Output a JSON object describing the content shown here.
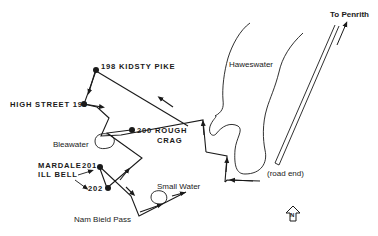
{
  "map": {
    "colors": {
      "ink": "#1a1a1a",
      "background": "#ffffff"
    },
    "labels": {
      "to_penrith": "To Penrith",
      "haweswater": "Haweswater",
      "kidsty_pike": "198 KIDSTY PIKE",
      "high_street": "HIGH STREET 199",
      "rough_crag_1": "200 ROUGH",
      "rough_crag_2": "CRAG",
      "bleawater": "Bleawater",
      "mardale_1": "MARDALE",
      "mardale_2": "ILL BELL",
      "point_201": "201",
      "point_202": "202",
      "small_water": "Small Water",
      "nam_bield_pass": "Nam Bield Pass",
      "road_end": "(road end)",
      "north_arrow": "N"
    },
    "waypoints": [
      {
        "id": "198",
        "name": "Kidsty Pike"
      },
      {
        "id": "199",
        "name": "High Street"
      },
      {
        "id": "200",
        "name": "Rough Crag"
      },
      {
        "id": "201",
        "name": "Mardale Ill Bell"
      },
      {
        "id": "202",
        "name": "Mardale Ill Bell"
      }
    ],
    "icons": [
      "north-arrow-icon",
      "direction-arrow-icon",
      "summit-dot-icon"
    ]
  }
}
